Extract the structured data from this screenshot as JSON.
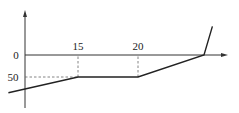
{
  "chart_data": {
    "type": "line",
    "title": "",
    "xlabel": "",
    "ylabel": "",
    "x_ticks": [
      "15",
      "20"
    ],
    "y_ticks": [
      "0",
      "50"
    ],
    "series": [
      {
        "name": "piecewise",
        "points": [
          {
            "x": 9.2,
            "y": -86
          },
          {
            "x": 15,
            "y": -50
          },
          {
            "x": 20,
            "y": -50
          },
          {
            "x": 25.5,
            "y": 0
          },
          {
            "x": 26.2,
            "y": 65
          }
        ]
      }
    ],
    "guides": [
      {
        "type": "dashed-vertical",
        "x": 15,
        "from_y": -50,
        "to_y": 0
      },
      {
        "type": "dashed-vertical",
        "x": 20,
        "from_y": -50,
        "to_y": 0
      },
      {
        "type": "dashed-horizontal",
        "y": -50,
        "from_x": 0,
        "to_x": 15
      }
    ],
    "grid": false,
    "legend": "none"
  }
}
